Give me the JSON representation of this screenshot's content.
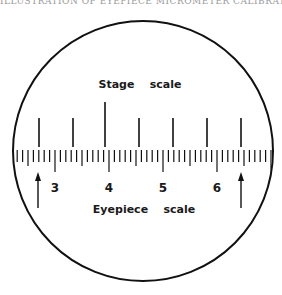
{
  "caption": "ILLUSTRATION OF EYEPIECE MICROMETER CALIBRATION",
  "diagram": {
    "title_top": "Stage    scale",
    "title_bottom": "Eyepiece    scale",
    "circle": {
      "cx": 143,
      "cy": 151,
      "r": 130,
      "stroke": "#111111"
    },
    "stage_scale": {
      "tick_x": [
        39,
        73,
        105,
        139,
        173,
        207,
        241
      ],
      "long_index": 2,
      "y_bottom": 147,
      "y_top_short": 118,
      "y_top_long": 102
    },
    "eyepiece_scale": {
      "baseline_y": 150,
      "start_x": 17,
      "end_x": 271,
      "unit_px": 54,
      "divisions_per_unit": 10,
      "labels": [
        {
          "text": "3",
          "x": 55
        },
        {
          "text": "4",
          "x": 109
        },
        {
          "text": "5",
          "x": 163
        },
        {
          "text": "6",
          "x": 217
        }
      ]
    },
    "arrows": [
      {
        "x": 38,
        "y_head": 172,
        "y_tail": 208
      },
      {
        "x": 241,
        "y_head": 172,
        "y_tail": 208
      }
    ]
  }
}
